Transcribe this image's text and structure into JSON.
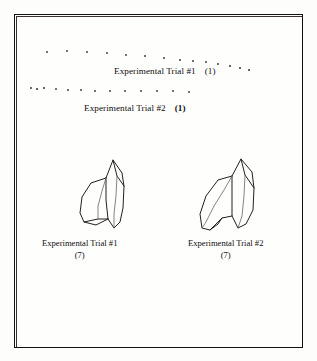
{
  "figure": {
    "background_color": "#fdfdfc",
    "ink_color": "#231f1e",
    "frame_color": "#14100f"
  },
  "dot_rows": [
    {
      "name": "dot-row-trial-1",
      "dots": [
        {
          "x": 47,
          "y": 52,
          "r": 1.0
        },
        {
          "x": 67,
          "y": 51,
          "r": 1.1
        },
        {
          "x": 87,
          "y": 52,
          "r": 1.2
        },
        {
          "x": 107,
          "y": 53,
          "r": 1.0
        },
        {
          "x": 126,
          "y": 55,
          "r": 1.0
        },
        {
          "x": 145,
          "y": 56,
          "r": 1.0
        },
        {
          "x": 164,
          "y": 58,
          "r": 0.9
        },
        {
          "x": 180,
          "y": 60,
          "r": 0.9
        },
        {
          "x": 193,
          "y": 61,
          "r": 0.9
        },
        {
          "x": 206,
          "y": 62,
          "r": 0.9
        },
        {
          "x": 218,
          "y": 64,
          "r": 0.9
        },
        {
          "x": 230,
          "y": 66,
          "r": 0.8
        },
        {
          "x": 240,
          "y": 68,
          "r": 0.8
        },
        {
          "x": 249,
          "y": 70,
          "r": 0.8
        }
      ]
    },
    {
      "name": "dot-row-trial-2",
      "dots": [
        {
          "x": 31,
          "y": 88,
          "r": 0.9
        },
        {
          "x": 37,
          "y": 89,
          "r": 0.8
        },
        {
          "x": 44,
          "y": 88,
          "r": 0.8
        },
        {
          "x": 56,
          "y": 89,
          "r": 1.0
        },
        {
          "x": 68,
          "y": 90,
          "r": 0.9
        },
        {
          "x": 81,
          "y": 90,
          "r": 0.9
        },
        {
          "x": 95,
          "y": 91,
          "r": 1.0
        },
        {
          "x": 110,
          "y": 91,
          "r": 1.0
        },
        {
          "x": 125,
          "y": 91,
          "r": 1.0
        },
        {
          "x": 141,
          "y": 91,
          "r": 1.0
        },
        {
          "x": 157,
          "y": 91,
          "r": 1.0
        },
        {
          "x": 173,
          "y": 91,
          "r": 1.0
        },
        {
          "x": 189,
          "y": 92,
          "r": 1.0
        }
      ]
    }
  ],
  "top_labels": [
    {
      "name": "top-label-trial-1",
      "text": "Experimental Trial #1",
      "paren": "(1)",
      "paren_bold": false,
      "x": 114,
      "y": 66
    },
    {
      "name": "top-label-trial-2",
      "text": "Experimental Trial #2",
      "paren": "(1)",
      "paren_bold": true,
      "x": 84,
      "y": 103
    }
  ],
  "bottom_labels": [
    {
      "name": "bottom-label-trial-1",
      "text": "Experimental Trial #1",
      "sub": "(7)",
      "x": 42,
      "y": 238
    },
    {
      "name": "bottom-label-trial-2",
      "text": "Experimental Trial #2",
      "sub": "(7)",
      "x": 188,
      "y": 238
    }
  ],
  "sketches": [
    {
      "name": "sketch-trial-1",
      "label": "Experimental Trial #1",
      "x": 76,
      "y": 156
    },
    {
      "name": "sketch-trial-2",
      "label": "Experimental Trial #2",
      "x": 196,
      "y": 156
    }
  ]
}
